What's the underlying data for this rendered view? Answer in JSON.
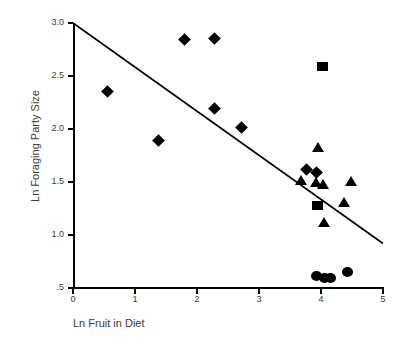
{
  "chart_data": {
    "type": "scatter",
    "title": "",
    "xlabel": "Ln Fruit in Diet",
    "ylabel": "Ln Foraging Party Size",
    "xlim": [
      0,
      5
    ],
    "ylim": [
      0.5,
      3.0
    ],
    "grid": false,
    "legend": "none",
    "xticks": [
      {
        "value": 0,
        "label": "0"
      },
      {
        "value": 1,
        "label": "1"
      },
      {
        "value": 2,
        "label": "2"
      },
      {
        "value": 3,
        "label": "3"
      },
      {
        "value": 4,
        "label": "4"
      },
      {
        "value": 5,
        "label": "5"
      }
    ],
    "yticks": [
      {
        "value": 0.5,
        "label": ".5"
      },
      {
        "value": 1.0,
        "label": "1.0"
      },
      {
        "value": 1.5,
        "label": "1.5"
      },
      {
        "value": 2.0,
        "label": "2.0"
      },
      {
        "value": 2.5,
        "label": "2.5"
      },
      {
        "value": 3.0,
        "label": "3.0"
      }
    ],
    "series": [
      {
        "name": "diamond",
        "marker": "diamond",
        "color": "#000000",
        "points": [
          {
            "x": 0.55,
            "y": 2.35
          },
          {
            "x": 1.38,
            "y": 1.89
          },
          {
            "x": 1.8,
            "y": 2.84
          },
          {
            "x": 2.28,
            "y": 2.85
          },
          {
            "x": 2.28,
            "y": 2.19
          },
          {
            "x": 2.72,
            "y": 2.01
          },
          {
            "x": 3.76,
            "y": 1.62
          },
          {
            "x": 3.92,
            "y": 1.59
          }
        ]
      },
      {
        "name": "square",
        "marker": "square",
        "color": "#000000",
        "points": [
          {
            "x": 4.03,
            "y": 2.59
          },
          {
            "x": 3.95,
            "y": 1.28
          }
        ]
      },
      {
        "name": "triangle",
        "marker": "triangle",
        "color": "#000000",
        "points": [
          {
            "x": 3.95,
            "y": 1.83
          },
          {
            "x": 3.68,
            "y": 1.52
          },
          {
            "x": 3.92,
            "y": 1.5
          },
          {
            "x": 4.03,
            "y": 1.48
          },
          {
            "x": 4.48,
            "y": 1.51
          },
          {
            "x": 4.37,
            "y": 1.31
          },
          {
            "x": 4.05,
            "y": 1.12
          }
        ]
      },
      {
        "name": "circle",
        "marker": "circle",
        "color": "#000000",
        "points": [
          {
            "x": 3.92,
            "y": 0.61
          },
          {
            "x": 4.05,
            "y": 0.59
          },
          {
            "x": 4.16,
            "y": 0.59
          },
          {
            "x": 4.42,
            "y": 0.65
          }
        ]
      }
    ],
    "trendline": {
      "x0": 0.0,
      "y0": 3.0,
      "x1": 5.0,
      "y1": 0.92,
      "color": "#000000"
    }
  }
}
